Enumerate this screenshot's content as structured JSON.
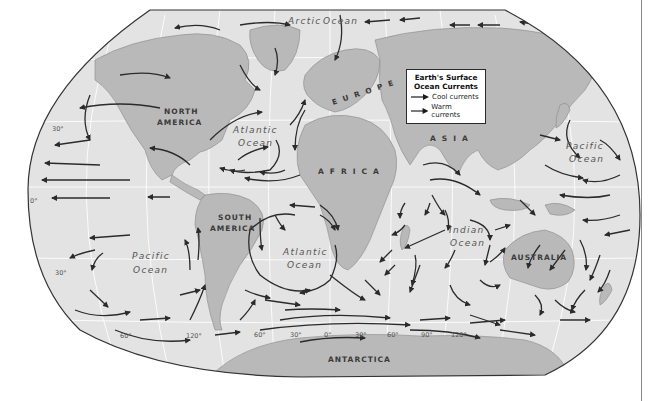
{
  "title": "Earth's Surface Ocean Currents",
  "legend": {
    "title_line1": "Earth's Surface",
    "title_line2": "Ocean Currents",
    "items": [
      {
        "label": "Cool currents",
        "color": "#1a1a1a"
      },
      {
        "label": "Warm currents",
        "color": "#1a1a1a"
      }
    ]
  },
  "continents": {
    "north_america": {
      "line1": "NORTH",
      "line2": "AMERICA"
    },
    "south_america": {
      "line1": "SOUTH",
      "line2": "AMERICA"
    },
    "europe": "EUROPE",
    "africa": "AFRICA",
    "asia": "ASIA",
    "australia": "AUSTRALIA",
    "antarctica": "ANTARCTICA"
  },
  "oceans": {
    "arctic": {
      "line1": "Arctic",
      "line2": "Ocean"
    },
    "north_atlantic": {
      "line1": "Atlantic",
      "line2": "Ocean"
    },
    "south_atlantic": {
      "line1": "Atlantic",
      "line2": "Ocean"
    },
    "south_pacific": {
      "line1": "Pacific",
      "line2": "Ocean"
    },
    "north_pacific": {
      "line1": "Pacific",
      "line2": "Ocean"
    },
    "indian": {
      "line1": "Indian",
      "line2": "Ocean"
    }
  },
  "latitude_labels": {
    "north_30": "30°",
    "equator": "0°",
    "south_30": "30°"
  },
  "longitude_labels": [
    "60°",
    "120°",
    "60°",
    "30°",
    "0°",
    "30°",
    "60°",
    "90°",
    "120°"
  ],
  "colors": {
    "ocean": "#e3e3e3",
    "land": "#b9b9b9",
    "arrow": "#2b2b2b",
    "outline": "#333333",
    "grid": "#ffffff"
  }
}
